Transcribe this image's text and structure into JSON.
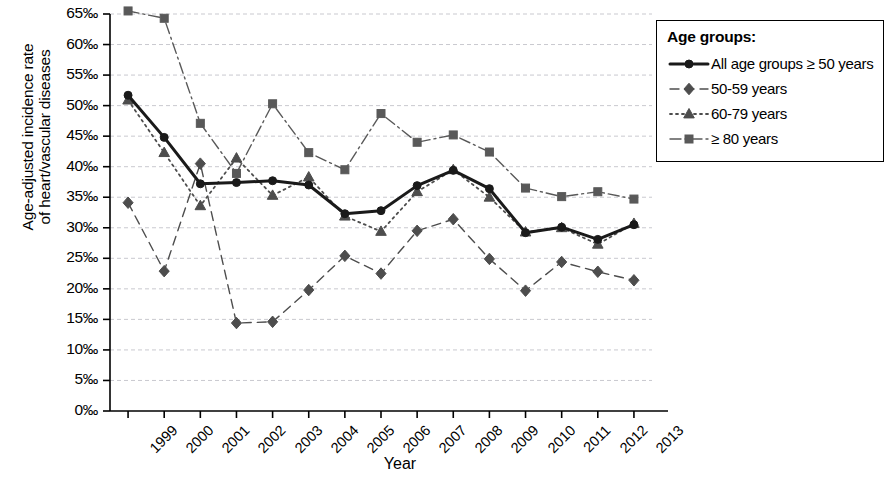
{
  "chart_data": {
    "type": "line",
    "title": "",
    "xlabel": "Year",
    "ylabel": "Age-adjusted incidence rate\nof heart/vascular diseases",
    "x": [
      "1999",
      "2000",
      "2001",
      "2002",
      "2003",
      "2004",
      "2005",
      "2006",
      "2007",
      "2008",
      "2009",
      "2010",
      "2011",
      "2012",
      "2013"
    ],
    "categories": [
      "1999",
      "2000",
      "2001",
      "2002",
      "2003",
      "2004",
      "2005",
      "2006",
      "2007",
      "2008",
      "2009",
      "2010",
      "2011",
      "2012",
      "2013"
    ],
    "ylim": [
      0,
      65
    ],
    "ytick_values": [
      0,
      5,
      10,
      15,
      20,
      25,
      30,
      35,
      40,
      45,
      50,
      55,
      60,
      65
    ],
    "ytick_labels": [
      "0‰",
      "5‰",
      "10‰",
      "15‰",
      "20‰",
      "25‰",
      "30‰",
      "35‰",
      "40‰",
      "45‰",
      "50‰",
      "55‰",
      "60‰",
      "65‰"
    ],
    "grid": true,
    "grid_axis": "y",
    "legend_position": "right-top",
    "legend_title": "Age groups:",
    "series": [
      {
        "name": "All age groups ≥ 50 years",
        "marker": "circle",
        "linestyle": "solid",
        "linewidth": 3,
        "color": "#1a1a1a",
        "values": [
          51.7,
          44.8,
          37.2,
          37.4,
          37.7,
          37.0,
          32.3,
          32.8,
          36.9,
          39.4,
          36.4,
          29.2,
          30.1,
          28.1,
          30.5
        ]
      },
      {
        "name": "50-59 years",
        "marker": "diamond",
        "linestyle": "dashed",
        "linewidth": 1.4,
        "color": "#4d4d4d",
        "values": [
          34.1,
          22.9,
          40.5,
          14.4,
          14.6,
          19.8,
          25.4,
          22.5,
          29.5,
          31.4,
          24.9,
          19.7,
          24.4,
          22.8,
          21.4
        ]
      },
      {
        "name": "60-79 years",
        "marker": "triangle",
        "linestyle": "dotted",
        "linewidth": 1.8,
        "color": "#4d4d4d",
        "values": [
          50.9,
          42.3,
          33.6,
          41.4,
          35.3,
          38.3,
          31.9,
          29.4,
          35.9,
          39.5,
          35.0,
          29.3,
          30.0,
          27.3,
          30.7
        ]
      },
      {
        "name": "≥ 80 years",
        "marker": "square",
        "linestyle": "dashdot",
        "linewidth": 1.4,
        "color": "#595959",
        "values": [
          65.5,
          64.3,
          47.1,
          38.9,
          50.3,
          42.3,
          39.5,
          48.7,
          44.0,
          45.2,
          42.4,
          36.5,
          35.1,
          35.9,
          34.7
        ]
      }
    ]
  },
  "axes": {
    "x_axis_name": "year-axis",
    "y_axis_name": "rate-axis"
  }
}
